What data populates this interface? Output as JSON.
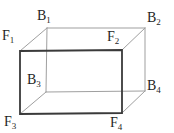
{
  "figure": {
    "type": "cuboid-wireframe",
    "colors": {
      "front_edge": "#3a3a3a",
      "back_edge": "#9f9f9f",
      "label": "#1f1f1f",
      "background": "#ffffff"
    },
    "labels": [
      {
        "id": "B1",
        "base": "B",
        "sub": "1"
      },
      {
        "id": "B2",
        "base": "B",
        "sub": "2"
      },
      {
        "id": "F1",
        "base": "F",
        "sub": "1"
      },
      {
        "id": "F2",
        "base": "F",
        "sub": "2"
      },
      {
        "id": "B3",
        "base": "B",
        "sub": "3"
      },
      {
        "id": "B4",
        "base": "B",
        "sub": "4"
      },
      {
        "id": "F3",
        "base": "F",
        "sub": "3"
      },
      {
        "id": "F4",
        "base": "F",
        "sub": "4"
      }
    ],
    "edges": {
      "front": [
        "F1-F2",
        "F2-F4",
        "F4-F3",
        "F3-F1"
      ],
      "back": [
        "B1-B2",
        "B2-B4",
        "B4-B3",
        "B3-B1",
        "F1-B1",
        "F2-B2",
        "F3-B3",
        "F4-B4"
      ]
    }
  }
}
